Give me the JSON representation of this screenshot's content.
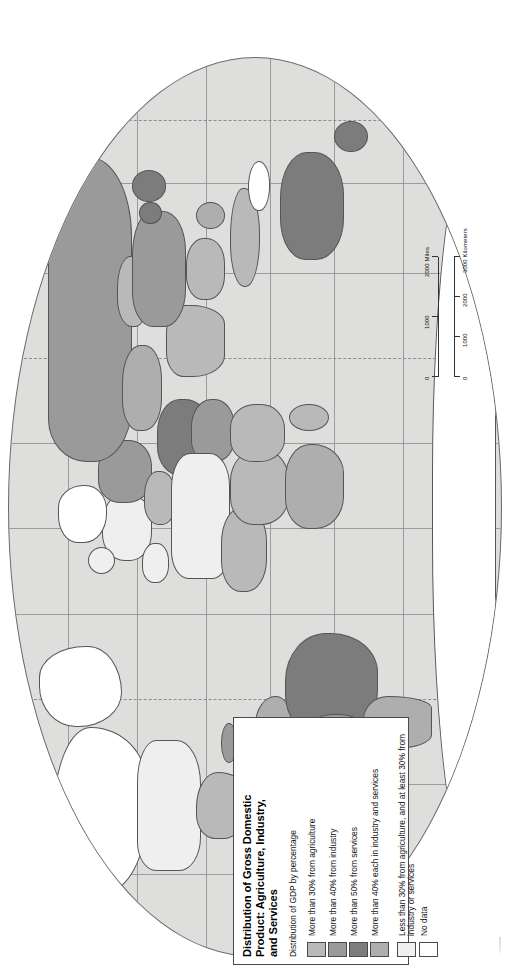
{
  "legend": {
    "title": "Distribution of Gross Domestic Product: Agriculture, Industry, and Services",
    "title_lines": [
      "Distribution of Gross Domestic",
      "Product: Agriculture, Industry,",
      "and Services"
    ],
    "subtitle": "Distribution of GDP by percentage",
    "items": [
      {
        "label": "More than 30% from agriculture",
        "color": "#b9b9b9",
        "swatch_class": "c1"
      },
      {
        "label": "More than 40% from industry",
        "color": "#9a9a9a",
        "swatch_class": "c2"
      },
      {
        "label": "More than 50% from services",
        "color": "#7c7c7c",
        "swatch_class": "c3"
      },
      {
        "label": "More than 40% each in industry and services",
        "color": "#aeaeae",
        "swatch_class": "c4"
      },
      {
        "label": "Less than 30% from agriculture, and at least 30% from industry or services",
        "color": "#efefef",
        "swatch_class": "c5"
      },
      {
        "label": "No data",
        "color": "#ffffff",
        "swatch_class": "c6"
      }
    ]
  },
  "scalebar": {
    "miles_unit": "2000 Miles",
    "miles_ticks": [
      "0",
      "1000",
      "2000 Miles"
    ],
    "km_unit": "3000 Kilometers",
    "km_ticks": [
      "0",
      "1000",
      "2000",
      "3000 Kilometers"
    ]
  },
  "map": {
    "projection": "oval-world",
    "ocean_color": "#dededc",
    "border_color": "#555555",
    "graticule_color": "#9b9b9b",
    "orientation": "rotated-90-ccw"
  }
}
